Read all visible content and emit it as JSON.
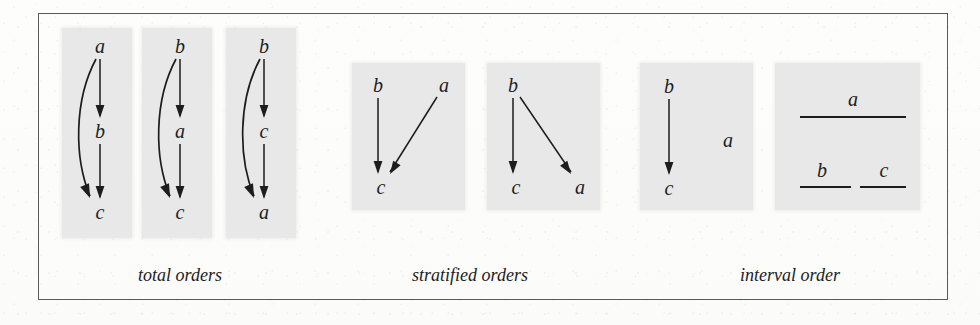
{
  "figure": {
    "background_color": "#fdfdfc",
    "frame_color": "#595959",
    "panel_color": "#e8e8e8",
    "ink_color": "#1d1d1d"
  },
  "groups": [
    {
      "id": "total-orders",
      "caption": "total orders",
      "caption_x": 180,
      "caption_y": 265,
      "diagrams": [
        {
          "id": "total-order-1",
          "panel": {
            "x": 62,
            "y": 28,
            "w": 70,
            "h": 210
          },
          "kind": "hasse",
          "nodes": [
            {
              "label": "a",
              "x": 100,
              "y": 46
            },
            {
              "label": "b",
              "x": 100,
              "y": 131
            },
            {
              "label": "c",
              "x": 100,
              "y": 212
            }
          ],
          "edges": [
            {
              "from": "a",
              "to": "b",
              "shape": "straight"
            },
            {
              "from": "b",
              "to": "c",
              "shape": "straight"
            },
            {
              "from": "a",
              "to": "c",
              "shape": "curved-left"
            }
          ]
        },
        {
          "id": "total-order-2",
          "panel": {
            "x": 142,
            "y": 28,
            "w": 70,
            "h": 210
          },
          "kind": "hasse",
          "nodes": [
            {
              "label": "b",
              "x": 180,
              "y": 46
            },
            {
              "label": "a",
              "x": 180,
              "y": 131
            },
            {
              "label": "c",
              "x": 180,
              "y": 212
            }
          ],
          "edges": [
            {
              "from": "b",
              "to": "a",
              "shape": "straight"
            },
            {
              "from": "a",
              "to": "c",
              "shape": "straight"
            },
            {
              "from": "b",
              "to": "c",
              "shape": "curved-left"
            }
          ]
        },
        {
          "id": "total-order-3",
          "panel": {
            "x": 226,
            "y": 28,
            "w": 70,
            "h": 210
          },
          "kind": "hasse",
          "nodes": [
            {
              "label": "b",
              "x": 264,
              "y": 46
            },
            {
              "label": "c",
              "x": 264,
              "y": 131
            },
            {
              "label": "a",
              "x": 264,
              "y": 212
            }
          ],
          "edges": [
            {
              "from": "b",
              "to": "c",
              "shape": "straight"
            },
            {
              "from": "c",
              "to": "a",
              "shape": "straight"
            },
            {
              "from": "b",
              "to": "a",
              "shape": "curved-left"
            }
          ]
        }
      ]
    },
    {
      "id": "stratified-orders",
      "caption": "stratified orders",
      "caption_x": 470,
      "caption_y": 265,
      "diagrams": [
        {
          "id": "stratified-order-1",
          "panel": {
            "x": 352,
            "y": 63,
            "w": 113,
            "h": 147
          },
          "kind": "hasse",
          "nodes": [
            {
              "label": "b",
              "x": 378,
              "y": 85
            },
            {
              "label": "a",
              "x": 444,
              "y": 85
            },
            {
              "label": "c",
              "x": 381,
              "y": 187
            }
          ],
          "edges": [
            {
              "from": "b",
              "to": "c",
              "shape": "straight"
            },
            {
              "from": "a",
              "to": "c",
              "shape": "diagonal"
            }
          ]
        },
        {
          "id": "stratified-order-2",
          "panel": {
            "x": 487,
            "y": 63,
            "w": 113,
            "h": 147
          },
          "kind": "hasse",
          "nodes": [
            {
              "label": "b",
              "x": 513,
              "y": 85
            },
            {
              "label": "c",
              "x": 516,
              "y": 187
            },
            {
              "label": "a",
              "x": 580,
              "y": 187
            }
          ],
          "edges": [
            {
              "from": "b",
              "to": "c",
              "shape": "straight"
            },
            {
              "from": "b",
              "to": "a",
              "shape": "diagonal"
            }
          ]
        }
      ]
    },
    {
      "id": "interval-order",
      "caption": "interval order",
      "caption_x": 790,
      "caption_y": 265,
      "diagrams": [
        {
          "id": "interval-order-hasse",
          "panel": {
            "x": 640,
            "y": 63,
            "w": 113,
            "h": 147
          },
          "kind": "hasse",
          "nodes": [
            {
              "label": "b",
              "x": 669,
              "y": 86
            },
            {
              "label": "c",
              "x": 669,
              "y": 188
            },
            {
              "label": "a",
              "x": 728,
              "y": 140
            }
          ],
          "edges": [
            {
              "from": "b",
              "to": "c",
              "shape": "straight"
            }
          ]
        },
        {
          "id": "interval-order-segments",
          "panel": {
            "x": 775,
            "y": 63,
            "w": 145,
            "h": 147
          },
          "kind": "intervals",
          "segments": [
            {
              "label": "a",
              "x1": 800,
              "x2": 906,
              "y": 117,
              "label_x": 853,
              "label_y": 99
            },
            {
              "label": "b",
              "x1": 800,
              "x2": 851,
              "y": 187,
              "label_x": 822,
              "label_y": 170
            },
            {
              "label": "c",
              "x1": 860,
              "x2": 906,
              "y": 187,
              "label_x": 884,
              "label_y": 170
            }
          ]
        }
      ]
    }
  ]
}
